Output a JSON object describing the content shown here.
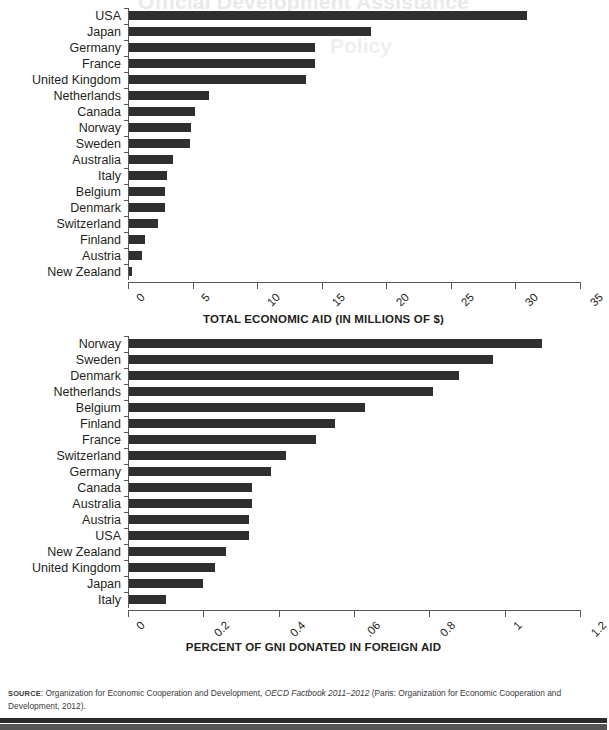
{
  "page": {
    "ghost_heading": "Official Development Assistance",
    "ghost_heading_2": "Policy",
    "source_prefix": "SOURCE",
    "source_text_1": ": Organization for Economic Cooperation and Development, ",
    "source_italic": "OECD Factbook 2011–2012",
    "source_text_2": " (Paris: Organization for Economic Cooperation and Development, 2012)."
  },
  "chart_data": [
    {
      "type": "bar",
      "orientation": "horizontal",
      "title": "",
      "xlabel": "TOTAL ECONOMIC AID (IN MILLIONS OF $)",
      "ylabel": "",
      "xlim": [
        0,
        35
      ],
      "xticks": [
        0,
        5,
        10,
        15,
        20,
        25,
        30,
        35
      ],
      "xticklabels": [
        "0",
        "5",
        "10",
        "15",
        "20",
        "25",
        "30",
        "35"
      ],
      "grid": false,
      "legend": false,
      "categories": [
        "USA",
        "Japan",
        "Germany",
        "France",
        "United Kingdom",
        "Netherlands",
        "Canada",
        "Norway",
        "Sweden",
        "Australia",
        "Italy",
        "Belgium",
        "Denmark",
        "Switzerland",
        "Finland",
        "Austria",
        "New Zealand"
      ],
      "values": [
        30.9,
        18.8,
        14.5,
        14.5,
        13.8,
        6.3,
        5.2,
        4.9,
        4.8,
        3.5,
        3.0,
        2.9,
        2.9,
        2.3,
        1.3,
        1.1,
        0.3
      ],
      "bar_color": "#2f2f2f"
    },
    {
      "type": "bar",
      "orientation": "horizontal",
      "title": "",
      "xlabel": "PERCENT OF GNI DONATED IN FOREIGN AID",
      "ylabel": "",
      "xlim": [
        0,
        1.2
      ],
      "xticks": [
        0,
        0.2,
        0.4,
        0.6,
        0.8,
        1.0,
        1.2
      ],
      "xticklabels": [
        "0",
        "0.2",
        "0.4",
        ".06",
        "0.8",
        "1",
        "1.2"
      ],
      "grid": false,
      "legend": false,
      "categories": [
        "Norway",
        "Sweden",
        "Denmark",
        "Netherlands",
        "Belgium",
        "Finland",
        "France",
        "Switzerland",
        "Germany",
        "Canada",
        "Australia",
        "Austria",
        "USA",
        "New Zealand",
        "United Kingdom",
        "Japan",
        "Italy"
      ],
      "values": [
        1.1,
        0.97,
        0.88,
        0.81,
        0.63,
        0.55,
        0.5,
        0.42,
        0.38,
        0.33,
        0.33,
        0.32,
        0.32,
        0.26,
        0.23,
        0.2,
        0.1
      ],
      "bar_color": "#2f2f2f"
    }
  ]
}
